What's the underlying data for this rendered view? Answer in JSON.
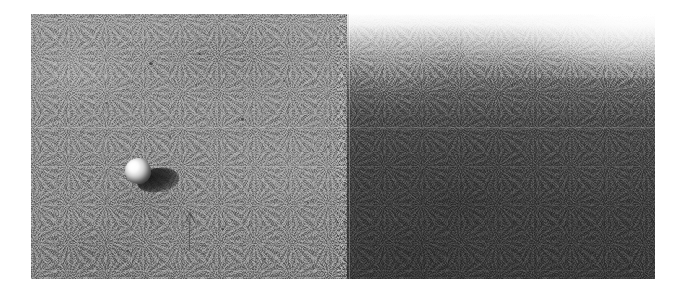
{
  "figure": {
    "kind": "scanned-grayscale-photograph",
    "description": "Grainy grayscale surface photograph formed from two stitched image panels; a brightly lit rounded rock casts a dark shadow on the lighter left panel, with a faint hand-drawn arrow pointing up at it.",
    "plate": {
      "left": 31,
      "top": 14,
      "width": 624,
      "height": 265,
      "background_color": "#ffffff"
    }
  },
  "panels": [
    {
      "id": "left-panel",
      "label": "Left panel",
      "tone": "light grey regolith",
      "base_color": "#8d8d8d",
      "x": 0,
      "width": 316
    },
    {
      "id": "right-panel",
      "label": "Right panel",
      "tone": "dark grey with blown-out highlight along the top edge",
      "base_color": "#3f3f3f",
      "highlight_color": "#ffffff",
      "x": 316,
      "width": 308
    }
  ],
  "seams": {
    "vertical_stitch_label": "vertical panel stitch line",
    "vertical_stitch_x": 318,
    "horizontal_scan_label": "horizontal scan seam",
    "horizontal_scan_y": 113
  },
  "rock": {
    "label": "illuminated rock",
    "shadow_label": "rock shadow",
    "highlight_label": "specular highlight",
    "x": 92,
    "y": 142,
    "lighting": "lit from upper left, shadow cast to the lower right",
    "body_color": "#d8d8d8",
    "shadow_color": "#1d1d1d"
  },
  "annotation": {
    "label": "hand-drawn arrow pointing at the rock",
    "x": 138,
    "y": 190,
    "color": "#2a2a2a",
    "opacity": 0.5
  },
  "specks": [
    {
      "x": 118,
      "y": 48,
      "w": 4,
      "h": 3
    },
    {
      "x": 167,
      "y": 39,
      "w": 3,
      "h": 2
    },
    {
      "x": 74,
      "y": 88,
      "w": 3,
      "h": 2
    },
    {
      "x": 210,
      "y": 104,
      "w": 3,
      "h": 3
    },
    {
      "x": 252,
      "y": 66,
      "w": 2,
      "h": 2
    },
    {
      "x": 56,
      "y": 166,
      "w": 3,
      "h": 2
    },
    {
      "x": 190,
      "y": 214,
      "w": 3,
      "h": 2
    },
    {
      "x": 276,
      "y": 188,
      "w": 2,
      "h": 2
    },
    {
      "x": 138,
      "y": 122,
      "w": 2,
      "h": 2
    },
    {
      "x": 232,
      "y": 244,
      "w": 3,
      "h": 2
    },
    {
      "x": 96,
      "y": 236,
      "w": 2,
      "h": 2
    },
    {
      "x": 296,
      "y": 132,
      "w": 2,
      "h": 2
    }
  ]
}
